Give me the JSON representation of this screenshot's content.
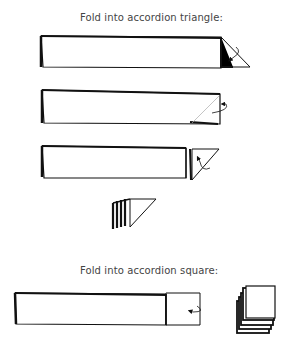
{
  "diagram": {
    "sections": [
      {
        "caption": "Fold into accordion triangle:",
        "steps": [
          {
            "name": "strip-with-triangle-fold-down",
            "arrow": "curved-arrow-down"
          },
          {
            "name": "strip-with-diagonal-fold-line",
            "arrow": "curved-arrow-back"
          },
          {
            "name": "strip-with-triangle-folded-forward",
            "arrow": "curved-arrow-up"
          },
          {
            "name": "accordion-triangle-stack",
            "arrow": null
          }
        ]
      },
      {
        "caption": "Fold into accordion square:",
        "steps": [
          {
            "name": "strip-with-square-fold",
            "arrow": "curved-arrow-left"
          },
          {
            "name": "accordion-square-stack",
            "arrow": null
          }
        ]
      }
    ],
    "colors": {
      "line": "#111111",
      "text": "#444444",
      "background": "#ffffff"
    }
  }
}
